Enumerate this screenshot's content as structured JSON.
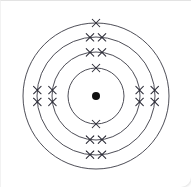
{
  "figure": {
    "background_color": "#ffffff",
    "ring_color": "#3a3a44",
    "electron_color": "#2d2d38",
    "nucleus_color": "#111111"
  },
  "chart_data": {
    "type": "scatter",
    "subtitle": "",
    "xlabel": "",
    "ylabel": "",
    "grid": false,
    "legend_position": "none",
    "annotations": [],
    "center": {
      "x": 95,
      "y": 95
    },
    "nucleus": {
      "label": "nucleus",
      "radius": 4,
      "color": "#111111"
    },
    "electron_symbol": "x",
    "shell_count": 4,
    "electron_configuration": "2, 8, 8, 1",
    "total_electrons": 19,
    "shells": [
      {
        "index": 1,
        "name": "K",
        "radius": 28,
        "electron_count": 2,
        "electron_angles_deg": [
          270,
          90
        ],
        "electrons": [
          {
            "angle_deg": 270,
            "offset": 0
          },
          {
            "angle_deg": 90,
            "offset": 0
          }
        ]
      },
      {
        "index": 2,
        "name": "L",
        "radius": 44,
        "electron_count": 8,
        "electron_angles_deg": [
          270,
          270,
          90,
          90,
          180,
          180,
          0,
          0
        ],
        "electrons": [
          {
            "angle_deg": 270,
            "offset": -6
          },
          {
            "angle_deg": 270,
            "offset": 6
          },
          {
            "angle_deg": 90,
            "offset": -6
          },
          {
            "angle_deg": 90,
            "offset": 6
          },
          {
            "angle_deg": 180,
            "offset": -6
          },
          {
            "angle_deg": 180,
            "offset": 6
          },
          {
            "angle_deg": 0,
            "offset": -6
          },
          {
            "angle_deg": 0,
            "offset": 6
          }
        ]
      },
      {
        "index": 3,
        "name": "M",
        "radius": 59,
        "electron_count": 8,
        "electron_angles_deg": [
          270,
          270,
          90,
          90,
          180,
          180,
          0,
          0
        ],
        "electrons": [
          {
            "angle_deg": 270,
            "offset": -6
          },
          {
            "angle_deg": 270,
            "offset": 6
          },
          {
            "angle_deg": 90,
            "offset": -6
          },
          {
            "angle_deg": 90,
            "offset": 6
          },
          {
            "angle_deg": 180,
            "offset": -6
          },
          {
            "angle_deg": 180,
            "offset": 6
          },
          {
            "angle_deg": 0,
            "offset": -6
          },
          {
            "angle_deg": 0,
            "offset": 6
          }
        ]
      },
      {
        "index": 4,
        "name": "N",
        "radius": 73,
        "electron_count": 1,
        "electron_angles_deg": [
          270
        ],
        "electrons": [
          {
            "angle_deg": 270,
            "offset": 0
          }
        ]
      }
    ]
  }
}
